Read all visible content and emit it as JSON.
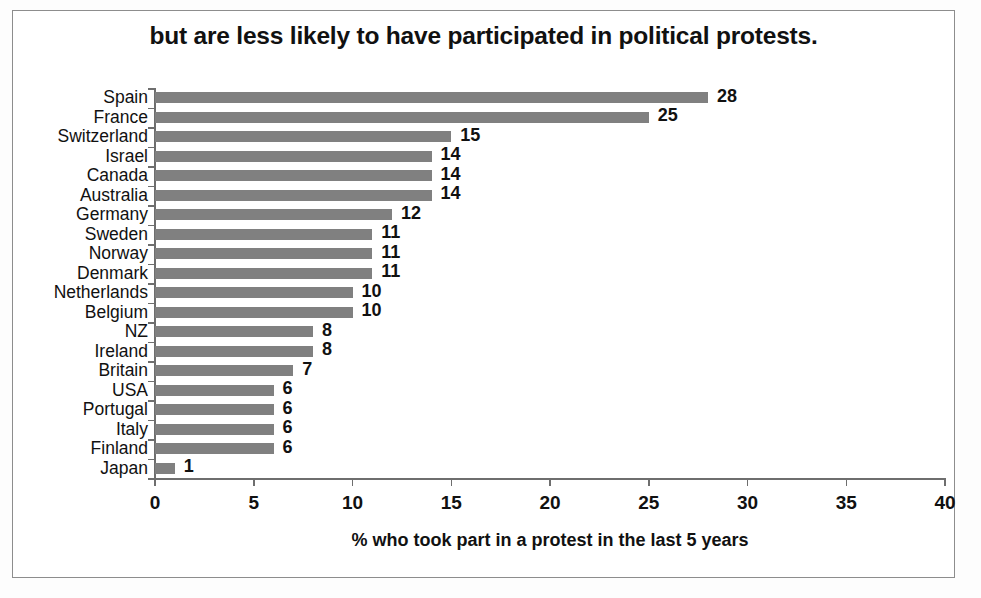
{
  "frame": {
    "border_color": "#8d8d8d",
    "background": "#ffffff"
  },
  "chart_data": {
    "type": "bar",
    "orientation": "horizontal",
    "title": "but are less likely to have participated in political protests.",
    "xlabel": "% who took part in a protest in the last 5 years",
    "ylabel": "",
    "xlim": [
      0,
      40
    ],
    "xticks": [
      0,
      5,
      10,
      15,
      20,
      25,
      30,
      35,
      40
    ],
    "xtick_labels": [
      "0",
      "5",
      "10",
      "15",
      "20",
      "25",
      "30",
      "35",
      "40"
    ],
    "grid": false,
    "legend": null,
    "bar_color": "#808080",
    "data_labels": true,
    "categories": [
      "Spain",
      "France",
      "Switzerland",
      "Israel",
      "Canada",
      "Australia",
      "Germany",
      "Sweden",
      "Norway",
      "Denmark",
      "Netherlands",
      "Belgium",
      "NZ",
      "Ireland",
      "Britain",
      "USA",
      "Portugal",
      "Italy",
      "Finland",
      "Japan"
    ],
    "values": [
      28,
      25,
      15,
      14,
      14,
      14,
      12,
      11,
      11,
      11,
      10,
      10,
      8,
      8,
      7,
      6,
      6,
      6,
      6,
      1
    ],
    "value_labels": [
      "28",
      "25",
      "15",
      "14",
      "14",
      "14",
      "12",
      "11",
      "11",
      "11",
      "10",
      "10",
      "8",
      "8",
      "7",
      "6",
      "6",
      "6",
      "6",
      "1"
    ]
  }
}
